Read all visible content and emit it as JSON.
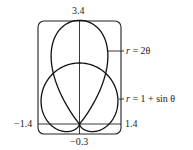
{
  "chart_data": {
    "type": "line",
    "title": "",
    "xlabel": "",
    "ylabel": "",
    "xlim": [
      -1.4,
      1.4
    ],
    "ylim": [
      -0.3,
      3.4
    ],
    "tick_labels": {
      "top": "3.4",
      "bottom": "−0.3",
      "left": "−1.4",
      "right": "1.4"
    },
    "series": [
      {
        "name": "r = 2θ",
        "kind": "polar",
        "description": "teardrop-shaped curve with cusp at (0, 3.4)"
      },
      {
        "name": "r = 1 + sin θ",
        "kind": "polar",
        "description": "cardioid, top at (0, 2), cusp at origin"
      }
    ],
    "annotations": [
      {
        "text": "r = 2θ",
        "points_to": "teardrop curve"
      },
      {
        "text": "r = 1 + sin θ",
        "points_to": "cardioid curve"
      }
    ],
    "grid": false,
    "legend": "none"
  },
  "labels": {
    "top": "3.4",
    "bottom": "−0.3",
    "left": "−1.4",
    "right": "1.4",
    "curve1_r": "r",
    "curve1_rest": " = 2θ",
    "curve2_r": "r",
    "curve2_rest": " = 1 + sin θ"
  }
}
